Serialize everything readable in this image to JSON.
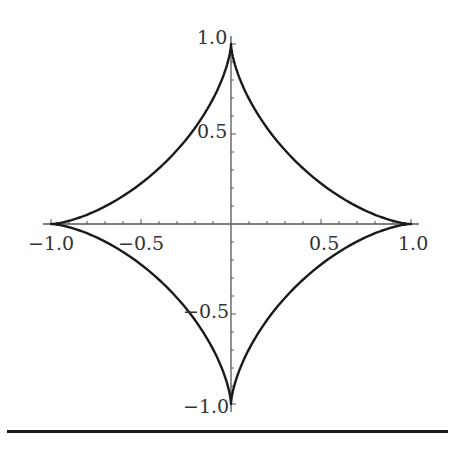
{
  "chart_data": {
    "type": "line",
    "title": "",
    "xlabel": "",
    "ylabel": "",
    "curve": "astroid x = cos^3(t), y = sin^3(t)",
    "parametric": {
      "x": "cos(t)^3",
      "y": "sin(t)^3",
      "t_range": [
        0,
        6.2832
      ]
    },
    "series": [
      {
        "name": "astroid",
        "color": "#1a1a1a",
        "samples": 200
      }
    ],
    "xlim": [
      -1.0,
      1.0
    ],
    "ylim": [
      -1.0,
      1.0
    ],
    "x_ticks": [
      -1.0,
      -0.5,
      0.5,
      1.0
    ],
    "y_ticks": [
      -1.0,
      -0.5,
      0.5,
      1.0
    ],
    "x_tick_labels": [
      "−1.0",
      "−0.5",
      "0.5",
      "1.0"
    ],
    "y_tick_labels": [
      "1.0",
      "0.5",
      "−0.5",
      "−1.0"
    ],
    "minor_ticks_per_major": 5,
    "grid": false,
    "legend": null,
    "axes_style": "cross-at-origin"
  },
  "layout": {
    "origin_px": [
      231,
      224
    ],
    "unit_px": 180,
    "axis_color": "#555555",
    "curve_color": "#1a1a1a"
  }
}
